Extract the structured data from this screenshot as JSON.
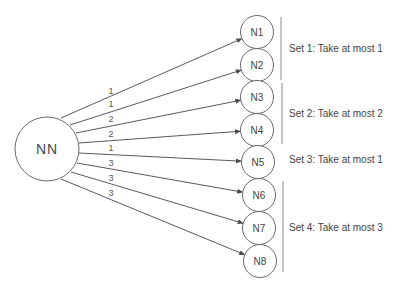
{
  "root": {
    "label": "NN",
    "cx": 47,
    "cy": 149,
    "r": 32
  },
  "nodes": [
    {
      "label": "N1",
      "cx": 257,
      "cy": 32,
      "r": 16.5
    },
    {
      "label": "N2",
      "cx": 257,
      "cy": 65,
      "r": 16.5
    },
    {
      "label": "N3",
      "cx": 257,
      "cy": 97,
      "r": 16.5
    },
    {
      "label": "N4",
      "cx": 257,
      "cy": 130,
      "r": 16.5
    },
    {
      "label": "N5",
      "cx": 258,
      "cy": 162,
      "r": 16.5
    },
    {
      "label": "N6",
      "cx": 259,
      "cy": 195,
      "r": 16.5
    },
    {
      "label": "N7",
      "cx": 259,
      "cy": 228,
      "r": 16.5
    },
    {
      "label": "N8",
      "cx": 260,
      "cy": 261,
      "r": 16.5
    }
  ],
  "edges": [
    {
      "to": "N1",
      "weight": "1",
      "x1": 61,
      "y1": 118,
      "label_x": 111,
      "label_y": 94
    },
    {
      "to": "N2",
      "weight": "1",
      "x1": 70,
      "y1": 125,
      "label_x": 111,
      "label_y": 107
    },
    {
      "to": "N3",
      "weight": "2",
      "x1": 76,
      "y1": 133,
      "label_x": 111,
      "label_y": 122
    },
    {
      "to": "N4",
      "weight": "2",
      "x1": 79,
      "y1": 143,
      "label_x": 111,
      "label_y": 137
    },
    {
      "to": "N5",
      "weight": "1",
      "x1": 79,
      "y1": 153,
      "label_x": 111,
      "label_y": 151
    },
    {
      "to": "N6",
      "weight": "3",
      "x1": 77,
      "y1": 163,
      "label_x": 111,
      "label_y": 166
    },
    {
      "to": "N7",
      "weight": "3",
      "x1": 71,
      "y1": 172,
      "label_x": 111,
      "label_y": 181
    },
    {
      "to": "N8",
      "weight": "3",
      "x1": 61,
      "y1": 179,
      "label_x": 111,
      "label_y": 196
    }
  ],
  "sets": [
    {
      "label": "Set 1: Take at most 1",
      "bar_x": 281,
      "y1": 17,
      "y2": 80,
      "label_y": 48
    },
    {
      "label": "Set 2: Take at most 2",
      "bar_x": 282,
      "y1": 83,
      "y2": 144,
      "label_y": 113
    },
    {
      "label": "Set 3: Take at most 1",
      "bar_x": null,
      "y1": null,
      "y2": null,
      "label_y": 159
    },
    {
      "label": "Set 4: Take at most 3",
      "bar_x": 283,
      "y1": 181,
      "y2": 272,
      "label_y": 227
    }
  ],
  "colors": {
    "stroke": "#6a6a6a",
    "text": "#444444",
    "background": "#ffffff"
  }
}
